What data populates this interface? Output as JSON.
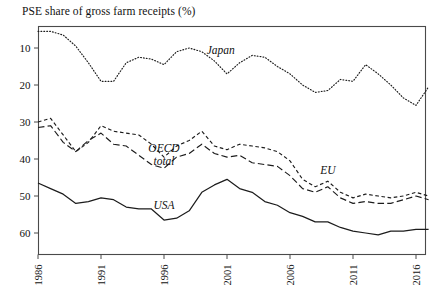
{
  "chart_data": {
    "type": "line",
    "title": "PSE share of gross farm receipts (%)",
    "xlabel": "",
    "ylabel": "",
    "xlim": [
      1986,
      2017
    ],
    "ylim": [
      3,
      67
    ],
    "yticks": [
      10,
      20,
      30,
      40,
      50,
      60
    ],
    "xticks": [
      1986,
      1991,
      1996,
      2001,
      2006,
      2011,
      2016
    ],
    "grid": false,
    "legend_position": "inline-annotations",
    "x": [
      1986,
      1987,
      1988,
      1989,
      1990,
      1991,
      1992,
      1993,
      1994,
      1995,
      1996,
      1997,
      1998,
      1999,
      2000,
      2001,
      2002,
      2003,
      2004,
      2005,
      2006,
      2007,
      2008,
      2009,
      2010,
      2011,
      2012,
      2013,
      2014,
      2015,
      2016,
      2017
    ],
    "series": [
      {
        "name": "Japan",
        "style": "dotted",
        "label": "Japan",
        "label_x": 2000.5,
        "label_y": 58.5,
        "values": [
          64.5,
          64.5,
          63.5,
          60.5,
          56.0,
          51.0,
          51.0,
          56.0,
          57.5,
          57.0,
          55.5,
          59.0,
          60.0,
          59.0,
          56.5,
          53.0,
          56.0,
          58.0,
          57.5,
          55.0,
          53.0,
          50.0,
          48.0,
          48.5,
          51.5,
          51.0,
          55.5,
          53.0,
          50.0,
          46.5,
          44.5,
          49.5
        ]
      },
      {
        "name": "OECD total",
        "style": "long-dashed",
        "label_line1": "OECD",
        "label_line2": "total",
        "label_x": 1996.0,
        "label_y": 32.0,
        "values": [
          38.5,
          39.0,
          34.5,
          32.0,
          35.0,
          37.0,
          34.0,
          33.5,
          31.0,
          28.5,
          27.5,
          30.5,
          31.5,
          34.0,
          31.5,
          30.5,
          31.0,
          29.0,
          28.5,
          28.0,
          25.5,
          22.0,
          21.0,
          22.5,
          19.5,
          18.0,
          18.5,
          18.0,
          18.0,
          19.0,
          20.0,
          19.0
        ]
      },
      {
        "name": "EU",
        "style": "short-dashed",
        "label": "EU",
        "label_x": 2009.0,
        "label_y": 26.0,
        "values": [
          40.0,
          41.0,
          36.5,
          32.0,
          34.5,
          39.0,
          37.5,
          37.0,
          36.5,
          34.0,
          30.5,
          33.5,
          35.0,
          37.5,
          33.5,
          32.5,
          34.0,
          33.5,
          33.0,
          32.0,
          29.5,
          24.5,
          22.5,
          24.0,
          21.0,
          19.5,
          20.5,
          20.0,
          19.5,
          20.0,
          21.0,
          20.0
        ]
      },
      {
        "name": "USA",
        "style": "solid",
        "label": "USA",
        "label_x": 1996.0,
        "label_y": 16.5,
        "values": [
          23.5,
          22.0,
          20.5,
          18.0,
          18.5,
          19.5,
          19.0,
          17.0,
          16.5,
          16.5,
          13.5,
          14.0,
          16.0,
          21.0,
          23.0,
          24.5,
          22.0,
          21.0,
          18.5,
          17.5,
          15.5,
          14.5,
          13.0,
          13.0,
          11.5,
          10.5,
          10.0,
          9.5,
          10.5,
          10.5,
          11.0,
          11.0
        ]
      }
    ]
  },
  "axes": {
    "ytick_labels": [
      "60",
      "50",
      "40",
      "30",
      "20",
      "10"
    ],
    "xtick_labels": [
      "1986",
      "1991",
      "1996",
      "2001",
      "2006",
      "2011",
      "2016"
    ]
  }
}
